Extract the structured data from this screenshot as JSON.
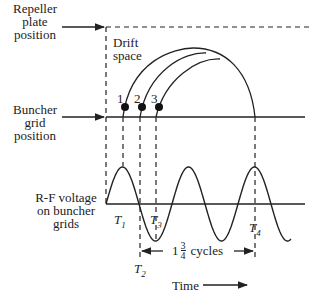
{
  "labels": {
    "repeller": [
      "Repeller",
      "plate",
      "position"
    ],
    "drift": [
      "Drift",
      "space"
    ],
    "buncher": [
      "Buncher",
      "grid",
      "position"
    ],
    "rf": [
      "R-F voltage",
      "on buncher",
      "grids"
    ],
    "electrons": [
      "1",
      "2",
      "3"
    ],
    "t1": "T",
    "t1_sub": "1",
    "t2": "T",
    "t2_sub": "2",
    "t3": "T",
    "t3_sub": "3",
    "t4": "T",
    "t4_sub": "4",
    "cycles_whole": "1",
    "cycles_num": "3",
    "cycles_den": "4",
    "cycles_word": "cycles",
    "time": "Time"
  },
  "colors": {
    "ink": "#222222"
  }
}
